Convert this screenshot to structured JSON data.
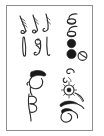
{
  "image": {
    "kind": "scanned-line-drawing",
    "description": "Framed plate of hand-drawn abstract glyph clusters",
    "background_color": "#ffffff",
    "ink_color": "#2b2b2b",
    "frame": {
      "name": "plate-border",
      "stroke_color": "#8e8e8e",
      "stroke_width": "1px",
      "left": 6,
      "top": 5,
      "width": 87,
      "height": 126
    },
    "layout": {
      "columns": 2,
      "rows": 2,
      "cluster_count": 4
    },
    "clusters": [
      {
        "id": "top-left",
        "position": "upper-left",
        "glyph_count": 4,
        "glyphs": [
          "feather-plume-glyph",
          "hooked-plume-glyph",
          "vertical-stroke-glyph",
          "coiled-loop-glyph"
        ]
      },
      {
        "id": "top-right",
        "position": "upper-right",
        "glyph_count": 5,
        "glyphs": [
          "ladle-outline-glyph",
          "ladle-filled-glyph",
          "solid-dot-glyph",
          "solid-dot-glyph",
          "crossed-circle-glyph"
        ]
      },
      {
        "id": "bottom-left",
        "position": "lower-left",
        "glyph_count": 3,
        "glyphs": [
          "profile-head-glyph",
          "capped-cap-glyph",
          "double-scroll-glyph"
        ]
      },
      {
        "id": "bottom-right",
        "position": "lower-right",
        "glyph_count": 6,
        "glyphs": [
          "small-hook-glyph",
          "tiny-arc-glyph",
          "spiral-eye-glyph",
          "swept-wing-glyph",
          "filled-blade-glyph",
          "curled-tail-glyph"
        ]
      }
    ]
  }
}
